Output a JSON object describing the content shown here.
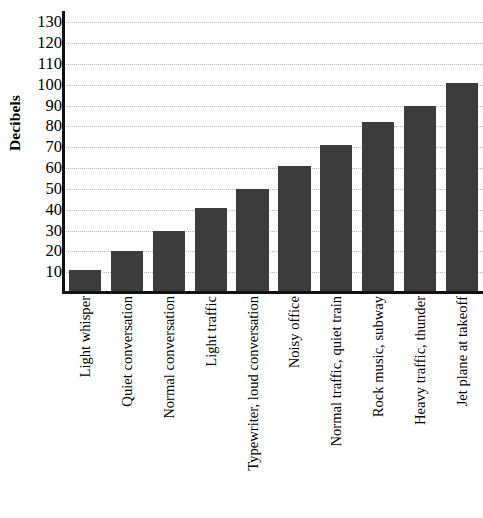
{
  "chart_data": {
    "type": "bar",
    "title": "",
    "xlabel": "",
    "ylabel": "Decibels",
    "ylim": [
      0,
      135
    ],
    "grid": true,
    "legend": null,
    "bar_color": "#3c3c3c",
    "gridline_color": "#b9b9b9",
    "axis_color": "#111111",
    "background_color": "#fdfdfd",
    "yticks": [
      130,
      120,
      110,
      100,
      90,
      80,
      70,
      60,
      50,
      40,
      30,
      20,
      10
    ],
    "categories": [
      "Light whisper",
      "Quiet conversation",
      "Normal conversation",
      "Light traffic",
      "Typewriter, loud conversation",
      "Noisy office",
      "Normal traffic, quiet train",
      "Rock music, subway",
      "Heavy traffic, thunder",
      "Jet plane at takeoff"
    ],
    "values": [
      11,
      20,
      30,
      41,
      50,
      61,
      71,
      82,
      90,
      101
    ]
  }
}
